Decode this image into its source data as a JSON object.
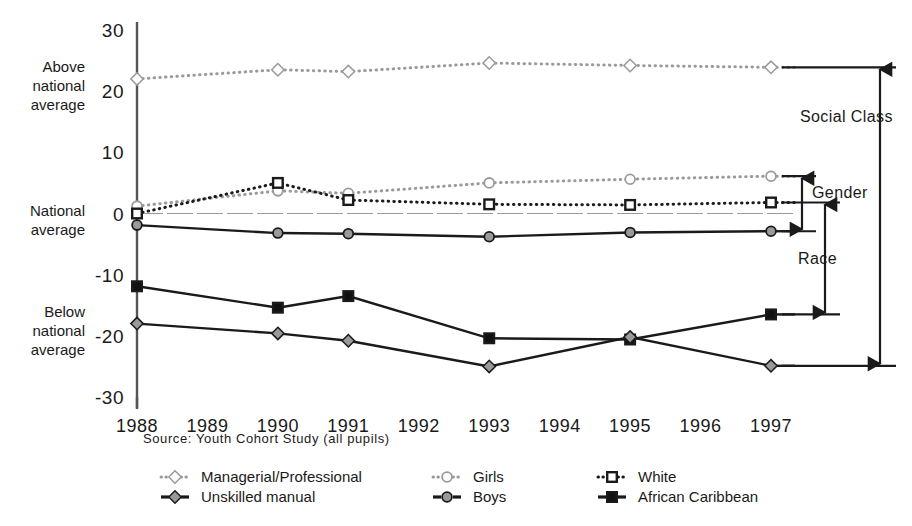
{
  "chart_data": {
    "type": "line",
    "title": "",
    "subtitle": "",
    "xlabel": "",
    "ylabel": "",
    "source": "Source: Youth Cohort Study (all pupils)",
    "grid": false,
    "legend_position": "bottom",
    "x": [
      1988,
      1989,
      1990,
      1991,
      1992,
      1993,
      1994,
      1995,
      1996,
      1997
    ],
    "xtick_labels": [
      "1988",
      "1989",
      "1990",
      "1991",
      "1992",
      "1993",
      "1994",
      "1995",
      "1996",
      "1997"
    ],
    "ylim": [
      -30,
      30
    ],
    "ytick_values": [
      30,
      20,
      10,
      0,
      -10,
      -20,
      -30
    ],
    "ytick_labels": [
      "30",
      "20",
      "10",
      "0",
      "-10",
      "-20",
      "-30"
    ],
    "y_axis_annotations": [
      {
        "label_lines": [
          "Above",
          "national",
          "average"
        ],
        "value": 21
      },
      {
        "label_lines": [
          "National",
          "average"
        ],
        "value": -1
      },
      {
        "label_lines": [
          "Below",
          "national",
          "average"
        ],
        "value": -19
      }
    ],
    "series": [
      {
        "name": "Managerial/Professional",
        "marker": "open-diamond",
        "line": "dotted",
        "color": "#9a9a9a",
        "marker_fill": "#ffffff",
        "x": [
          1988,
          1990,
          1991,
          1993,
          1995,
          1997
        ],
        "values": [
          22.0,
          23.5,
          23.2,
          24.6,
          24.2,
          23.9
        ]
      },
      {
        "name": "Girls",
        "marker": "open-circle",
        "line": "dotted",
        "color": "#9a9a9a",
        "marker_fill": "#ffffff",
        "x": [
          1988,
          1990,
          1991,
          1993,
          1995,
          1997
        ],
        "values": [
          1.2,
          3.7,
          3.3,
          5.0,
          5.6,
          6.1
        ]
      },
      {
        "name": "White",
        "marker": "open-square",
        "line": "dotted",
        "color": "#1a1a1a",
        "marker_fill": "#ffffff",
        "x": [
          1988,
          1990,
          1991,
          1993,
          1995,
          1997
        ],
        "values": [
          0.0,
          5.0,
          2.2,
          1.5,
          1.4,
          1.8
        ]
      },
      {
        "name": "Boys",
        "marker": "filled-circle",
        "line": "solid",
        "color": "#1a1a1a",
        "marker_fill": "#9a9a9a",
        "x": [
          1988,
          1990,
          1991,
          1993,
          1995,
          1997
        ],
        "values": [
          -1.9,
          -3.2,
          -3.3,
          -3.8,
          -3.1,
          -2.9
        ]
      },
      {
        "name": "African Caribbean",
        "marker": "filled-square",
        "line": "solid",
        "color": "#1a1a1a",
        "marker_fill": "#111111",
        "x": [
          1988,
          1990,
          1991,
          1993,
          1995,
          1997
        ],
        "values": [
          -11.9,
          -15.4,
          -13.5,
          -20.4,
          -20.6,
          -16.5
        ]
      },
      {
        "name": "Unskilled manual",
        "marker": "filled-diamond",
        "line": "solid",
        "color": "#1a1a1a",
        "marker_fill": "#9a9a9a",
        "x": [
          1988,
          1990,
          1991,
          1993,
          1995,
          1997
        ],
        "values": [
          -18.0,
          -19.6,
          -20.8,
          -25.0,
          -20.2,
          -24.9
        ]
      }
    ],
    "gap_annotations": [
      {
        "label": "Social Class",
        "top_value": 23.9,
        "bottom_value": -24.9,
        "column": 3
      },
      {
        "label": "Gender",
        "top_value": 6.1,
        "bottom_value": -2.9,
        "column": 1
      },
      {
        "label": "Race",
        "top_value": 1.8,
        "bottom_value": -16.5,
        "column": 2
      }
    ]
  },
  "legend": {
    "items": [
      {
        "label": "Managerial/Professional",
        "series": "Managerial/Professional",
        "col": 0,
        "row": 0
      },
      {
        "label": "Unskilled manual",
        "series": "Unskilled manual",
        "col": 0,
        "row": 1
      },
      {
        "label": "Girls",
        "series": "Girls",
        "col": 1,
        "row": 0
      },
      {
        "label": "Boys",
        "series": "Boys",
        "col": 1,
        "row": 1
      },
      {
        "label": "White",
        "series": "White",
        "col": 2,
        "row": 0
      },
      {
        "label": "African Caribbean",
        "series": "African Caribbean",
        "col": 2,
        "row": 1
      }
    ]
  },
  "colors": {
    "ink": "#1a1a1a",
    "grey": "#9a9a9a",
    "paper": "#ffffff"
  }
}
